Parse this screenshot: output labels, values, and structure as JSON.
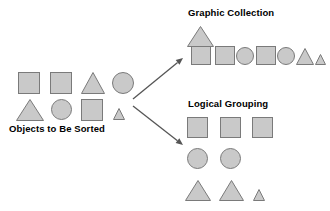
{
  "diagram": {
    "title_source_group": "Objects to Be Sorted",
    "title_graphic_group": "Graphic Collection",
    "title_logical_group": "Logical Grouping",
    "colors": {
      "shape_fill": "#c9c9c9",
      "shape_stroke": "#7a7a7a",
      "arrow": "#555555",
      "text": "#000000",
      "background": "#ffffff"
    },
    "arrows": [
      {
        "name": "arrow-to-graphic-collection",
        "from_x": 133,
        "from_y": 99,
        "to_x": 183,
        "to_y": 58
      },
      {
        "name": "arrow-to-logical-grouping",
        "from_x": 133,
        "from_y": 106,
        "to_x": 183,
        "to_y": 145
      }
    ],
    "groups": {
      "source": {
        "label": "Objects to Be Sorted",
        "shapes": [
          {
            "kind": "square",
            "x": 18,
            "y": 72,
            "w": 22,
            "h": 22
          },
          {
            "kind": "square",
            "x": 50,
            "y": 72,
            "w": 22,
            "h": 22
          },
          {
            "kind": "triangle",
            "x": 81,
            "y": 72,
            "w": 24,
            "h": 22
          },
          {
            "kind": "circle",
            "x": 112,
            "y": 72,
            "w": 22,
            "h": 22
          },
          {
            "kind": "triangle",
            "x": 16,
            "y": 99,
            "w": 28,
            "h": 22
          },
          {
            "kind": "circle",
            "x": 51,
            "y": 99,
            "w": 21,
            "h": 21
          },
          {
            "kind": "square",
            "x": 81,
            "y": 99,
            "w": 22,
            "h": 22
          },
          {
            "kind": "triangle",
            "x": 113,
            "y": 108,
            "w": 12,
            "h": 12
          }
        ]
      },
      "graphic_collection": {
        "label": "Graphic Collection",
        "shapes": [
          {
            "kind": "triangle",
            "x": 187,
            "y": 26,
            "w": 27,
            "h": 21
          },
          {
            "kind": "square",
            "x": 191,
            "y": 46,
            "w": 20,
            "h": 19
          },
          {
            "kind": "square",
            "x": 215,
            "y": 46,
            "w": 20,
            "h": 19
          },
          {
            "kind": "circle",
            "x": 236,
            "y": 47,
            "w": 18,
            "h": 18
          },
          {
            "kind": "square",
            "x": 256,
            "y": 46,
            "w": 20,
            "h": 19
          },
          {
            "kind": "circle",
            "x": 277,
            "y": 47,
            "w": 18,
            "h": 18
          },
          {
            "kind": "triangle",
            "x": 296,
            "y": 48,
            "w": 18,
            "h": 17
          },
          {
            "kind": "triangle",
            "x": 315,
            "y": 54,
            "w": 11,
            "h": 11
          }
        ]
      },
      "logical_grouping": {
        "label": "Logical Grouping",
        "rows": [
          {
            "name": "squares-row",
            "shapes": [
              {
                "kind": "square",
                "x": 187,
                "y": 117,
                "w": 21,
                "h": 21
              },
              {
                "kind": "square",
                "x": 220,
                "y": 117,
                "w": 21,
                "h": 21
              },
              {
                "kind": "square",
                "x": 252,
                "y": 117,
                "w": 21,
                "h": 21
              }
            ]
          },
          {
            "name": "circles-row",
            "shapes": [
              {
                "kind": "circle",
                "x": 187,
                "y": 148,
                "w": 21,
                "h": 21
              },
              {
                "kind": "circle",
                "x": 220,
                "y": 148,
                "w": 21,
                "h": 21
              }
            ]
          },
          {
            "name": "triangles-row",
            "shapes": [
              {
                "kind": "triangle",
                "x": 185,
                "y": 180,
                "w": 26,
                "h": 21
              },
              {
                "kind": "triangle",
                "x": 219,
                "y": 180,
                "w": 25,
                "h": 21
              },
              {
                "kind": "triangle",
                "x": 253,
                "y": 189,
                "w": 12,
                "h": 12
              }
            ]
          }
        ]
      }
    }
  }
}
